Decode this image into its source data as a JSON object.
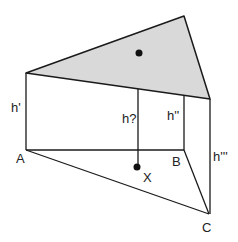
{
  "diagram": {
    "type": "triangular prism interpolation",
    "colors": {
      "top_face_fill": "#d9d9d9",
      "stroke": "#1a1a1a",
      "background": "#ffffff"
    },
    "labels": {
      "a": "A",
      "b": "B",
      "c": "C",
      "x": "X",
      "h_a": "h'",
      "h_b": "h''",
      "h_c": "h'''",
      "h_x": "h?"
    }
  }
}
